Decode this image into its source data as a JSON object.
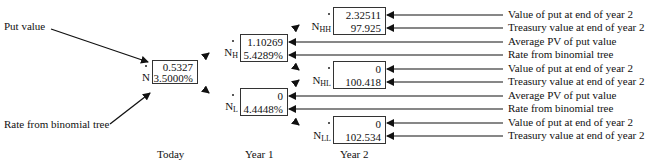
{
  "left_labels": {
    "put_value": "Put value",
    "rate": "Rate from binomial tree"
  },
  "nodes": {
    "N": {
      "name": "N",
      "sub": "",
      "top": "0.5327",
      "bottom": "3.5000%"
    },
    "NH": {
      "name": "N",
      "sub": "H",
      "top": "1.10269",
      "bottom": "5.4289%"
    },
    "NL": {
      "name": "N",
      "sub": "L",
      "top": "0",
      "bottom": "4.4448%"
    },
    "NHH": {
      "name": "N",
      "sub": "HH",
      "top": "2.32511",
      "bottom": "97.925"
    },
    "NHL": {
      "name": "N",
      "sub": "HL",
      "top": "0",
      "bottom": "100.418"
    },
    "NLL": {
      "name": "N",
      "sub": "LL",
      "top": "0",
      "bottom": "102.534"
    }
  },
  "right_labels": [
    "Value of put at end of year 2",
    "Treasury value at end of year 2",
    "Average PV of put value",
    "Rate from binomial tree",
    "Value of put at end of year 2",
    "Treasury value at end of year 2",
    "Average PV of put value",
    "Rate from binomial tree",
    "Value of put at end of year 2",
    "Treasury value at end of year 2"
  ],
  "time_axis": {
    "today": "Today",
    "year1": "Year 1",
    "year2": "Year 2"
  }
}
